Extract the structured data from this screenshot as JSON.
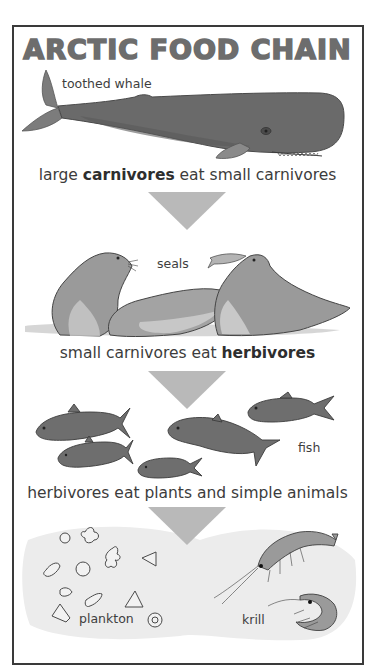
{
  "title": "ARCTIC FOOD CHAIN",
  "colors": {
    "frame_border": "#3a3a3a",
    "title_text": "#6d6d6d",
    "arrow": "#b9b9b9",
    "whale": "#6a6a6a",
    "seal": "#9a9a9a",
    "fish": "#6e6e6e",
    "plankton_bg": "#ececec",
    "krill": "#9a9a9a"
  },
  "levels": [
    {
      "animal_label": "toothed whale",
      "icon": "toothed-whale-illustration",
      "caption": {
        "prefix": "large ",
        "bold": "carnivores",
        "suffix": " eat small carnivores"
      }
    },
    {
      "animal_label": "seals",
      "icon": "seals-illustration",
      "caption": {
        "prefix": "small carnivores eat ",
        "bold": "herbivores",
        "suffix": ""
      }
    },
    {
      "animal_label": "fish",
      "icon": "fish-illustration",
      "caption": {
        "prefix": "herbivores eat plants and simple animals",
        "bold": "",
        "suffix": ""
      }
    },
    {
      "animal_label": "plankton",
      "icon": "plankton-illustration",
      "secondary_label": "krill",
      "secondary_icon": "krill-illustration"
    }
  ],
  "arrows": [
    {
      "icon": "down-arrow-icon"
    },
    {
      "icon": "down-arrow-icon"
    },
    {
      "icon": "down-arrow-icon"
    }
  ]
}
